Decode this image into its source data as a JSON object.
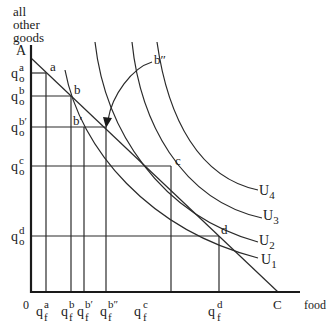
{
  "diagram": {
    "type": "indifference-curve-budget-constraint",
    "y_axis_label": [
      "all",
      "other",
      "goods"
    ],
    "x_axis_label": "food",
    "origin_label": "0",
    "intercepts": {
      "y": "A",
      "x": "C"
    },
    "points": [
      {
        "id": "a",
        "label": "a"
      },
      {
        "id": "b",
        "label": "b"
      },
      {
        "id": "b1",
        "label": "b′"
      },
      {
        "id": "b2",
        "label": "b″"
      },
      {
        "id": "c",
        "label": "c"
      },
      {
        "id": "d",
        "label": "d"
      }
    ],
    "y_ticks": [
      {
        "base": "q",
        "sub": "o",
        "sup": "a"
      },
      {
        "base": "q",
        "sub": "o",
        "sup": "b"
      },
      {
        "base": "q",
        "sub": "o",
        "sup": "b′"
      },
      {
        "base": "q",
        "sub": "o",
        "sup": "c"
      },
      {
        "base": "q",
        "sub": "o",
        "sup": "d"
      }
    ],
    "x_ticks": [
      {
        "base": "q",
        "sub": "f",
        "sup": "a"
      },
      {
        "base": "q",
        "sub": "f",
        "sup": "b"
      },
      {
        "base": "q",
        "sub": "f",
        "sup": "b′"
      },
      {
        "base": "q",
        "sub": "f",
        "sup": "b″"
      },
      {
        "base": "q",
        "sub": "f",
        "sup": "c"
      },
      {
        "base": "q",
        "sub": "f",
        "sup": "d"
      }
    ],
    "curves": [
      {
        "name": "U",
        "sub": "1"
      },
      {
        "name": "U",
        "sub": "2"
      },
      {
        "name": "U",
        "sub": "3"
      },
      {
        "name": "U",
        "sub": "4"
      }
    ]
  }
}
